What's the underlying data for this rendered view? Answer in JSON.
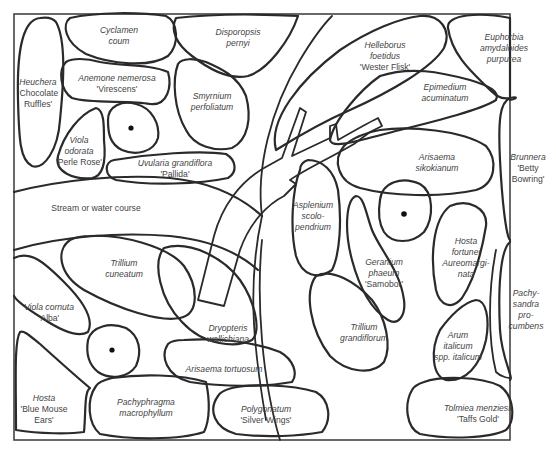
{
  "diagram": {
    "stream_label": "Stream or water course",
    "trees": [
      {
        "name": "tree-1",
        "cx": 130,
        "cy": 128
      },
      {
        "name": "tree-2",
        "cx": 404,
        "cy": 215
      },
      {
        "name": "tree-3",
        "cx": 112,
        "cy": 350
      }
    ],
    "plants": [
      {
        "id": "cyclamen",
        "lines": [
          "Cyclamen",
          "coum"
        ],
        "cultivar": "",
        "x": 119,
        "y": 25
      },
      {
        "id": "disporopsis",
        "lines": [
          "Disporopsis",
          "pernyi"
        ],
        "cultivar": "",
        "x": 238,
        "y": 27
      },
      {
        "id": "heuchera",
        "lines": [
          "Heuchera"
        ],
        "cultivar": "'Chocolate\nRuffles'",
        "x": 38,
        "y": 77
      },
      {
        "id": "anemone",
        "lines": [
          "Anemone nemerosa"
        ],
        "cultivar": "'Virescens'",
        "x": 117,
        "y": 73
      },
      {
        "id": "smyrnium",
        "lines": [
          "Smyrnium",
          "perfoliatum"
        ],
        "cultivar": "",
        "x": 212,
        "y": 91
      },
      {
        "id": "viola-odorata",
        "lines": [
          "Viola",
          "odorata"
        ],
        "cultivar": "'Perle Rose'",
        "x": 79,
        "y": 135
      },
      {
        "id": "uvularia",
        "lines": [
          "Uvularia grandiflora"
        ],
        "cultivar": "'Pallida'",
        "x": 175,
        "y": 158
      },
      {
        "id": "helleborus",
        "lines": [
          "Helleborus",
          "foetidus"
        ],
        "cultivar": "'Wester Flisk'",
        "x": 385,
        "y": 40
      },
      {
        "id": "euphorbia",
        "lines": [
          "Euphorbia",
          "amydaloides",
          "purpurea"
        ],
        "cultivar": "",
        "x": 504,
        "y": 32
      },
      {
        "id": "epimedium",
        "lines": [
          "Epimedium",
          "acuminatum"
        ],
        "cultivar": "",
        "x": 445,
        "y": 82
      },
      {
        "id": "arisaema-sikokianum",
        "lines": [
          "Arisaema",
          "sikokianum"
        ],
        "cultivar": "",
        "x": 437,
        "y": 152
      },
      {
        "id": "brunnera",
        "lines": [
          "Brunnera"
        ],
        "cultivar": "'Betty\nBowring'",
        "x": 528,
        "y": 152
      },
      {
        "id": "asplenium",
        "lines": [
          "Asplenium",
          "scolo-",
          "pendrium"
        ],
        "cultivar": "",
        "x": 313,
        "y": 200
      },
      {
        "id": "geranium",
        "lines": [
          "Geranium",
          "phaeum"
        ],
        "cultivar": "'Samobor'",
        "x": 384,
        "y": 257
      },
      {
        "id": "hosta-fortunei",
        "lines": [
          "Hosta",
          "fortunei",
          "Aureomargi-",
          "nata"
        ],
        "cultivar": "",
        "x": 466,
        "y": 236
      },
      {
        "id": "pachysandra",
        "lines": [
          "Pachy-",
          "sandra",
          "pro-",
          "cumbens"
        ],
        "cultivar": "",
        "x": 526,
        "y": 288
      },
      {
        "id": "trillium-cuneatum",
        "lines": [
          "Trillium",
          "cuneatum"
        ],
        "cultivar": "",
        "x": 124,
        "y": 258
      },
      {
        "id": "viola-cornuta",
        "lines": [
          "Viola cornuta"
        ],
        "cultivar": "'Alba'",
        "x": 49,
        "y": 302
      },
      {
        "id": "dryopteris",
        "lines": [
          "Dryopteris",
          "wallichiana"
        ],
        "cultivar": "",
        "x": 228,
        "y": 323
      },
      {
        "id": "trillium-grandiflorum",
        "lines": [
          "Trillium",
          "grandiflorum"
        ],
        "cultivar": "",
        "x": 364,
        "y": 322
      },
      {
        "id": "arum",
        "lines": [
          "Arum",
          "italicum",
          "spp. italicum"
        ],
        "cultivar": "",
        "x": 458,
        "y": 330
      },
      {
        "id": "arisaema-tortuosum",
        "lines": [
          "Arisaema tortuosum"
        ],
        "cultivar": "",
        "x": 224,
        "y": 364
      },
      {
        "id": "hosta-blue",
        "lines": [
          "Hosta"
        ],
        "cultivar": "'Blue Mouse\nEars'",
        "x": 44,
        "y": 393
      },
      {
        "id": "pachyphragma",
        "lines": [
          "Pachyphragma",
          "macrophyllum"
        ],
        "cultivar": "",
        "x": 146,
        "y": 397
      },
      {
        "id": "polygonatum",
        "lines": [
          "Polygonatum"
        ],
        "cultivar": "'Silver Wings'",
        "x": 266,
        "y": 404
      },
      {
        "id": "tolmiea",
        "lines": [
          "Tolmiea menziesii"
        ],
        "cultivar": "'Taffs Gold'",
        "x": 478,
        "y": 403
      }
    ]
  }
}
